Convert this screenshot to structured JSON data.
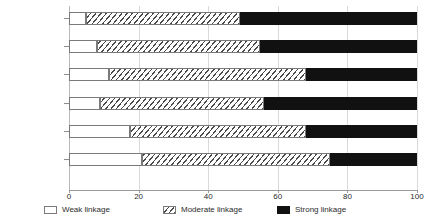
{
  "chart_data": {
    "type": "bar",
    "orientation": "horizontal",
    "stacked": true,
    "title": "",
    "subtitle": "",
    "xlabel": "",
    "ylabel": "",
    "xlim": [
      0,
      100
    ],
    "xticks": [
      0,
      20,
      40,
      60,
      80,
      100
    ],
    "xticklabels": [
      "0",
      "20",
      "40",
      "60",
      "80",
      "100"
    ],
    "grid": true,
    "grid_axis": "x",
    "legend_position": "bottom",
    "categories": [
      "HR planning",
      "Staffing",
      "Compensation",
      "Training",
      "Labour relations",
      "EEO"
    ],
    "series": [
      {
        "name": "Weak linkage",
        "style": "white-filled",
        "color": "#ffffff",
        "values": [
          5,
          8,
          11.5,
          9,
          17.5,
          21
        ]
      },
      {
        "name": "Moderate linkage",
        "style": "diagonal-hatch",
        "color": "#ffffff",
        "values": [
          44,
          47,
          56.5,
          47,
          50.5,
          54
        ]
      },
      {
        "name": "Strong linkage",
        "style": "solid-black",
        "color": "#111111",
        "values": [
          51,
          45,
          32,
          44,
          32,
          25
        ]
      }
    ],
    "cumulative_boundaries": [
      {
        "category": "HR planning",
        "weak_end": 5,
        "moderate_end": 49,
        "strong_end": 100
      },
      {
        "category": "Staffing",
        "weak_end": 8,
        "moderate_end": 55,
        "strong_end": 100
      },
      {
        "category": "Compensation",
        "weak_end": 11.5,
        "moderate_end": 68,
        "strong_end": 100
      },
      {
        "category": "Training",
        "weak_end": 9,
        "moderate_end": 56,
        "strong_end": 100
      },
      {
        "category": "Labour relations",
        "weak_end": 17.5,
        "moderate_end": 68,
        "strong_end": 100
      },
      {
        "category": "EEO",
        "weak_end": 21,
        "moderate_end": 75,
        "strong_end": 100
      }
    ]
  },
  "legend": {
    "items": [
      {
        "label": "Weak linkage",
        "swatch": "weak"
      },
      {
        "label": "Moderate linkage",
        "swatch": "moderate"
      },
      {
        "label": "Strong linkage",
        "swatch": "strong"
      }
    ]
  },
  "colors": {
    "strong": "#111111",
    "hatch_line": "#4a4a4a",
    "bar_outline": "#7a7a7a",
    "gridline": "#d9d9d9",
    "axis": "#9a9a9a",
    "text": "#2b2b2b",
    "background": "#ffffff"
  }
}
